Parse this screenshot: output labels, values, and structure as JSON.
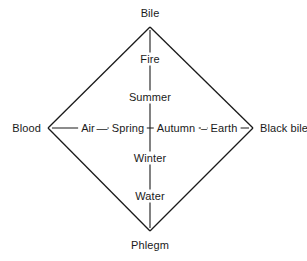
{
  "figure": {
    "background_color": "#ffffff",
    "line_color": "#1a1a1a",
    "text_color": "#1a1a1a"
  },
  "corners": {
    "top": "Bile",
    "bottom": "Phlegm",
    "left": "Blood",
    "right": "Black bile"
  },
  "vertical_axis": {
    "upper_element": "Fire",
    "upper_season": "Summer",
    "lower_season": "Winter",
    "lower_element": "Water"
  },
  "horizontal_axis": {
    "left_element": "Air",
    "left_season": "Spring",
    "right_season": "Autumn",
    "right_element": "Earth"
  },
  "connectors": {
    "left_dash": "—",
    "right_dash": "–"
  }
}
